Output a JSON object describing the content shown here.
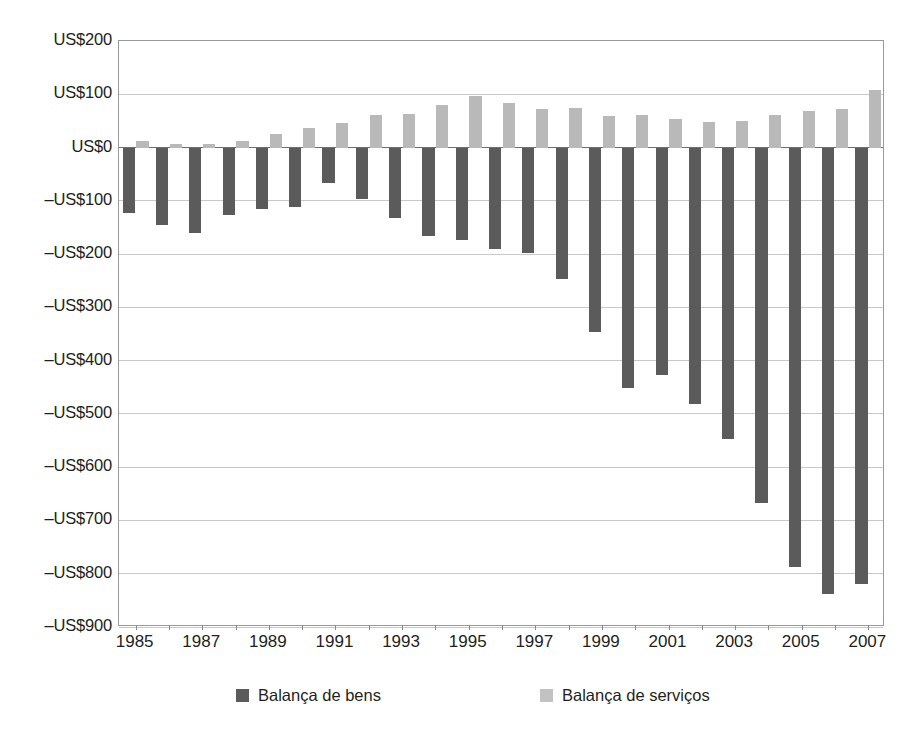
{
  "chart_data": {
    "type": "bar",
    "title": "",
    "subtitle": "",
    "xlabel": "",
    "ylabel": "",
    "ylim": [
      -900,
      200
    ],
    "ytick_step": 100,
    "grid": true,
    "legend_position": "bottom",
    "currency_prefix": "US$",
    "categories": [
      "1985",
      "1986",
      "1987",
      "1988",
      "1989",
      "1990",
      "1991",
      "1992",
      "1993",
      "1994",
      "1995",
      "1996",
      "1997",
      "1998",
      "1999",
      "2000",
      "2001",
      "2002",
      "2003",
      "2004",
      "2005",
      "2006",
      "2007"
    ],
    "xtick_labels": [
      "1985",
      "1987",
      "1989",
      "1991",
      "1993",
      "1995",
      "1997",
      "1999",
      "2001",
      "2003",
      "2005",
      "2007"
    ],
    "ytick_labels": [
      "US$200",
      "US$100",
      "US$0",
      "–US$100",
      "–US$200",
      "–US$300",
      "–US$400",
      "–US$500",
      "–US$600",
      "–US$700",
      "–US$800",
      "–US$900"
    ],
    "ytick_values": [
      200,
      100,
      0,
      -100,
      -200,
      -300,
      -400,
      -500,
      -600,
      -700,
      -800,
      -900
    ],
    "series": [
      {
        "name": "Balança de bens",
        "color": "#5b5b5b",
        "values": [
          -122,
          -145,
          -160,
          -127,
          -115,
          -111,
          -66,
          -96,
          -132,
          -166,
          -174,
          -191,
          -198,
          -247,
          -346,
          -452,
          -427,
          -482,
          -547,
          -668,
          -787,
          -838,
          -819
        ]
      },
      {
        "name": "Balança de serviços",
        "color": "#b9b9b9",
        "values": [
          12,
          7,
          7,
          12,
          26,
          37,
          46,
          61,
          63,
          79,
          96,
          84,
          73,
          74,
          60,
          61,
          53,
          48,
          50,
          62,
          68,
          72,
          108
        ]
      }
    ]
  },
  "legend": {
    "items": [
      {
        "label": "Balança de bens",
        "swatch": "dark-gray-swatch"
      },
      {
        "label": "Balança de serviços",
        "swatch": "light-gray-swatch"
      }
    ]
  }
}
